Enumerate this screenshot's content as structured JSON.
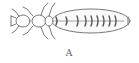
{
  "figure": {
    "label": "A",
    "stroke_color": "#6a6a6a"
  }
}
